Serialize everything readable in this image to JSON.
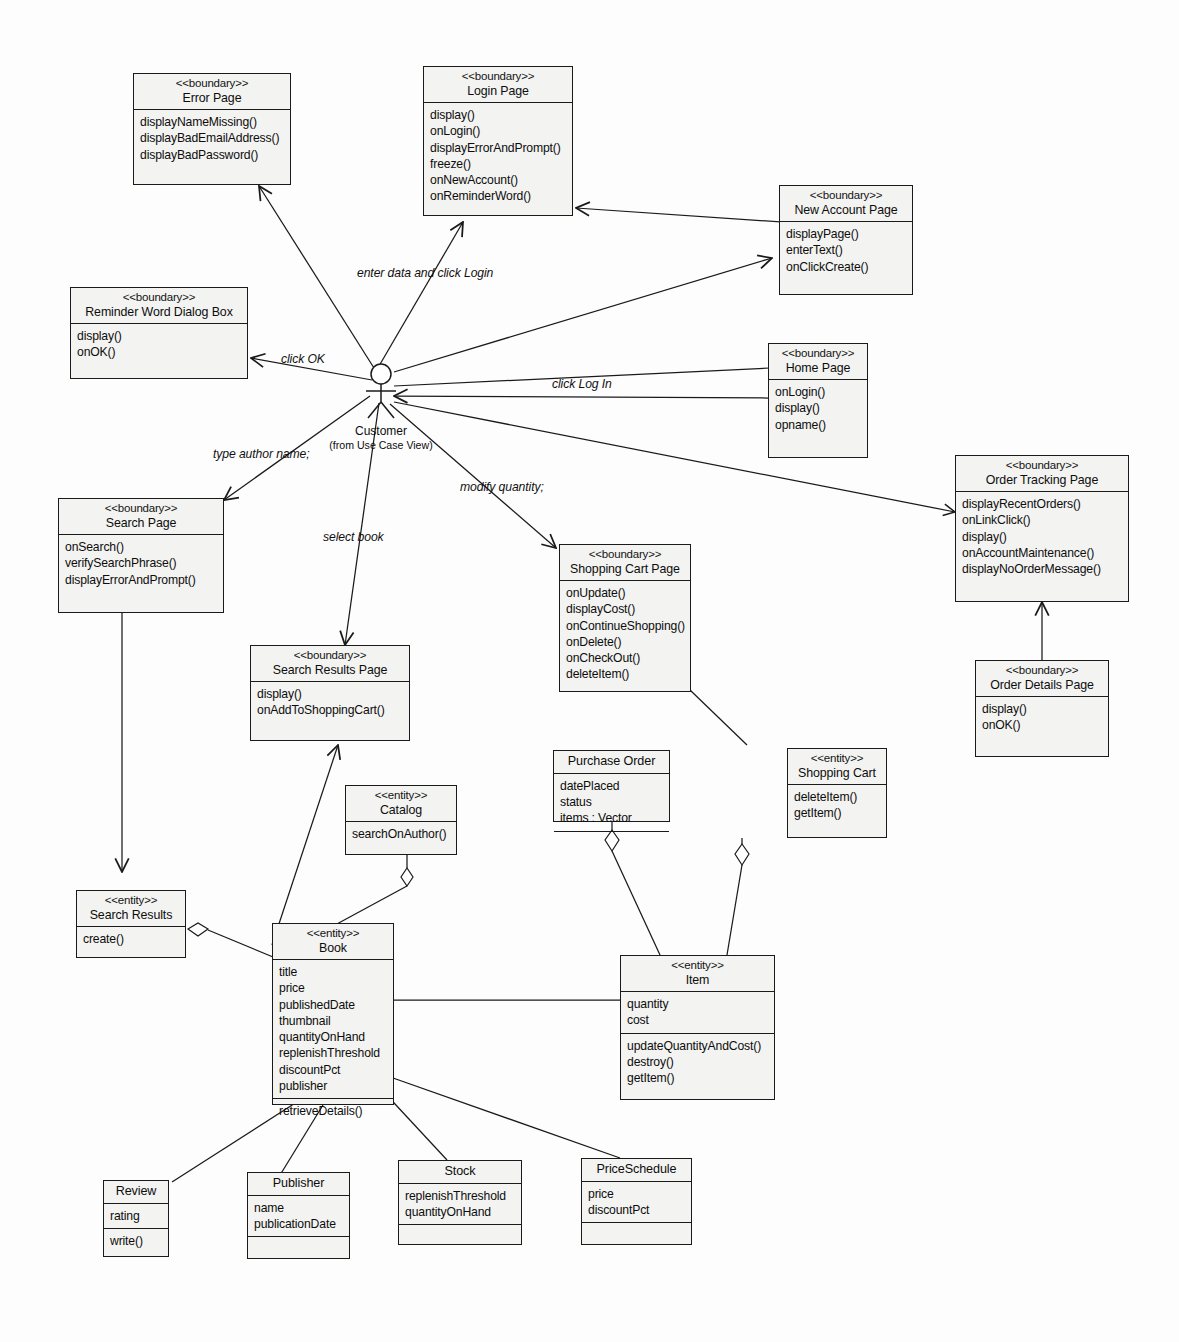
{
  "diagram": {
    "actor": {
      "name": "Customer",
      "qualifier": "(from Use Case View)"
    },
    "edge_labels": [
      {
        "id": "enter-login",
        "text": "enter data and click Login"
      },
      {
        "id": "click-ok",
        "text": "click OK"
      },
      {
        "id": "click-login",
        "text": "click Log In"
      },
      {
        "id": "type-author",
        "text": "type author name;"
      },
      {
        "id": "select-book",
        "text": "select book"
      },
      {
        "id": "modify-quantity",
        "text": "modify quantity;"
      }
    ],
    "classes": [
      {
        "id": "error-page",
        "stereotype": "<<boundary>>",
        "name": "Error Page",
        "attributes": [],
        "operations": [
          "displayNameMissing()",
          "displayBadEmailAddress()",
          "displayBadPassword()"
        ]
      },
      {
        "id": "login-page",
        "stereotype": "<<boundary>>",
        "name": "Login Page",
        "attributes": [],
        "operations": [
          "display()",
          "onLogin()",
          "displayErrorAndPrompt()",
          "freeze()",
          "onNewAccount()",
          "onReminderWord()"
        ]
      },
      {
        "id": "new-account-page",
        "stereotype": "<<boundary>>",
        "name": "New Account Page",
        "attributes": [],
        "operations": [
          "displayPage()",
          "enterText()",
          "onClickCreate()"
        ]
      },
      {
        "id": "reminder-word-dialog-box",
        "stereotype": "<<boundary>>",
        "name": "Reminder Word Dialog Box",
        "attributes": [],
        "operations": [
          "display()",
          "onOK()"
        ]
      },
      {
        "id": "home-page",
        "stereotype": "<<boundary>>",
        "name": "Home Page",
        "attributes": [],
        "operations": [
          "onLogin()",
          "display()",
          "opname()"
        ]
      },
      {
        "id": "order-tracking-page",
        "stereotype": "<<boundary>>",
        "name": "Order Tracking Page",
        "attributes": [],
        "operations": [
          "displayRecentOrders()",
          "onLinkClick()",
          "display()",
          "onAccountMaintenance()",
          "displayNoOrderMessage()"
        ]
      },
      {
        "id": "order-details-page",
        "stereotype": "<<boundary>>",
        "name": "Order Details Page",
        "attributes": [],
        "operations": [
          "display()",
          "onOK()"
        ]
      },
      {
        "id": "search-page",
        "stereotype": "<<boundary>>",
        "name": "Search Page",
        "attributes": [],
        "operations": [
          "onSearch()",
          "verifySearchPhrase()",
          "displayErrorAndPrompt()"
        ]
      },
      {
        "id": "search-results-page",
        "stereotype": "<<boundary>>",
        "name": "Search Results Page",
        "attributes": [],
        "operations": [
          "display()",
          "onAddToShoppingCart()"
        ]
      },
      {
        "id": "shopping-cart-page",
        "stereotype": "<<boundary>>",
        "name": "Shopping Cart Page",
        "attributes": [],
        "operations": [
          "onUpdate()",
          "displayCost()",
          "onContinueShopping()",
          "onDelete()",
          "onCheckOut()",
          "deleteItem()"
        ]
      },
      {
        "id": "purchase-order",
        "stereotype": "",
        "name": "Purchase Order",
        "attributes": [
          "datePlaced",
          "status",
          "items : Vector"
        ],
        "operations": []
      },
      {
        "id": "shopping-cart",
        "stereotype": "<<entity>>",
        "name": "Shopping Cart",
        "attributes": [],
        "operations": [
          "deleteItem()",
          "getItem()"
        ]
      },
      {
        "id": "catalog",
        "stereotype": "<<entity>>",
        "name": "Catalog",
        "attributes": [],
        "operations": [
          "searchOnAuthor()"
        ]
      },
      {
        "id": "search-results",
        "stereotype": "<<entity>>",
        "name": "Search Results",
        "attributes": [],
        "operations": [
          "create()"
        ]
      },
      {
        "id": "book",
        "stereotype": "<<entity>>",
        "name": "Book",
        "attributes": [
          "title",
          "price",
          "publishedDate",
          "thumbnail",
          "quantityOnHand",
          "replenishThreshold",
          "discountPct",
          "publisher"
        ],
        "operations": [
          "retrieveDetails()"
        ]
      },
      {
        "id": "item",
        "stereotype": "<<entity>>",
        "name": "Item",
        "attributes": [
          "quantity",
          "cost"
        ],
        "operations": [
          "updateQuantityAndCost()",
          "destroy()",
          "getItem()"
        ]
      },
      {
        "id": "review",
        "stereotype": "",
        "name": "Review",
        "attributes": [
          "rating"
        ],
        "operations": [
          "write()"
        ]
      },
      {
        "id": "publisher",
        "stereotype": "",
        "name": "Publisher",
        "attributes": [
          "name",
          "publicationDate"
        ],
        "operations": []
      },
      {
        "id": "stock",
        "stereotype": "",
        "name": "Stock",
        "attributes": [
          "replenishThreshold",
          "quantityOnHand"
        ],
        "operations": []
      },
      {
        "id": "price-schedule",
        "stereotype": "",
        "name": "PriceSchedule",
        "attributes": [
          "price",
          "discountPct"
        ],
        "operations": []
      }
    ],
    "colors": {
      "line": "#1a1a1a",
      "fill": "#f3f3f1",
      "background": "#fdfdfd",
      "text": "#0d0d0d"
    }
  }
}
